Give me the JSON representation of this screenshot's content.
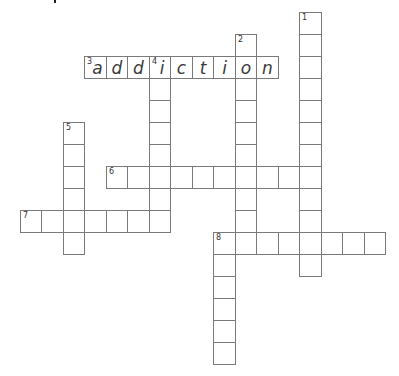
{
  "puzzle": {
    "grid": {
      "origin_x": 84,
      "origin_y": 56,
      "cell_w": 21.5,
      "cell_h": 22
    },
    "words": [
      {
        "number": "1",
        "direction": "down",
        "row": -2,
        "col": 10,
        "length": 12,
        "letters": ""
      },
      {
        "number": "2",
        "direction": "down",
        "row": -1,
        "col": 7,
        "length": 10,
        "letters": " o"
      },
      {
        "number": "3",
        "direction": "across",
        "row": 0,
        "col": 0,
        "length": 9,
        "letters": "addiction"
      },
      {
        "number": "4",
        "direction": "down",
        "row": 0,
        "col": 3,
        "length": 8,
        "letters": "i"
      },
      {
        "number": "5",
        "direction": "down",
        "row": 3,
        "col": -1,
        "length": 6,
        "letters": ""
      },
      {
        "number": "6",
        "direction": "across",
        "row": 5,
        "col": 1,
        "length": 10,
        "letters": ""
      },
      {
        "number": "7",
        "direction": "across",
        "row": 7,
        "col": -3,
        "length": 7,
        "letters": ""
      },
      {
        "number": "8",
        "direction": "across",
        "row": 8,
        "col": 6,
        "length": 8,
        "letters": ""
      },
      {
        "number": "",
        "direction": "down",
        "row": 8,
        "col": 6,
        "length": 6,
        "letters": ""
      }
    ]
  }
}
